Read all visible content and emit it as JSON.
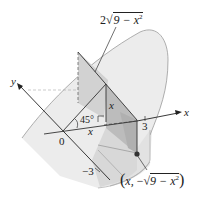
{
  "figure": {
    "colors": {
      "background": "#ffffff",
      "solid_light": "#ececec",
      "solid_mid": "#dcdcdc",
      "cross_section": "#c8c8c8",
      "cross_section_dark": "#b4b4b4",
      "line": "#333333",
      "axis": "#222222",
      "point": "#333333"
    }
  },
  "labels": {
    "top_dimension": "2√(9 − x²)",
    "top_dimension_coef": "2",
    "top_dimension_radicand": "9 − x",
    "top_dimension_exp": "2",
    "y_axis": "y",
    "x_axis": "x",
    "origin": "0",
    "angle": "45°",
    "height_x": "x",
    "base_x": "x",
    "tick_3": "3",
    "tick_neg3": "−3",
    "point_open": "(",
    "point_x": "x,",
    "point_minus": "−",
    "point_radicand": "9 − x",
    "point_exp": "2",
    "point_close": ")"
  }
}
